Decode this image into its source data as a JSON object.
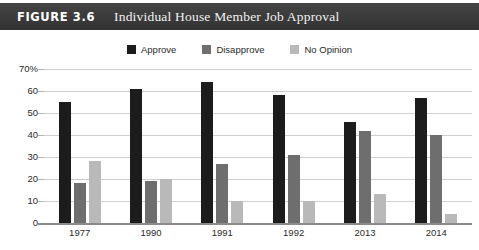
{
  "figure": {
    "label": "FIGURE 3.6",
    "title": "Individual House Member Job Approval",
    "titlebar_color": "#3b3b3b",
    "titlebar_text_color": "#ffffff"
  },
  "chart_data": {
    "type": "bar",
    "title": "Individual House Member Job Approval",
    "xlabel": "",
    "ylabel": "",
    "ylim": [
      0,
      70
    ],
    "yticks": [
      70,
      60,
      50,
      40,
      30,
      20,
      10,
      0
    ],
    "ytick_labels": [
      "70%",
      "60",
      "50",
      "40",
      "30",
      "20",
      "10",
      "0"
    ],
    "grid": true,
    "legend_position": "top-center",
    "categories": [
      "1977",
      "1990",
      "1991",
      "1992",
      "2013",
      "2014"
    ],
    "series": [
      {
        "name": "Approve",
        "color": "#1c1c1c",
        "values": [
          55,
          61,
          64,
          58,
          46,
          57
        ]
      },
      {
        "name": "Disapprove",
        "color": "#6e6e6e",
        "values": [
          18,
          19,
          27,
          31,
          42,
          40
        ]
      },
      {
        "name": "No Opinion",
        "color": "#b9b9b9",
        "values": [
          28,
          20,
          10,
          10,
          13,
          4
        ]
      }
    ]
  }
}
